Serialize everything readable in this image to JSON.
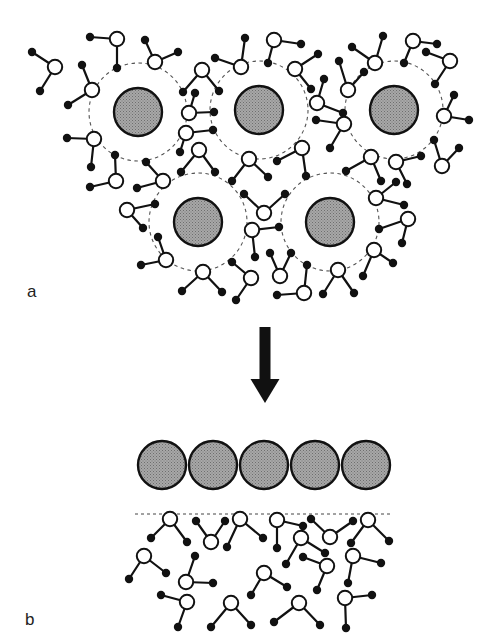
{
  "figure": {
    "labels": {
      "a": "a",
      "b": "b"
    },
    "colors": {
      "particle_fill": "#9c9c9c",
      "outline": "#111111",
      "oxygen_fill": "#ffffff",
      "hydrogen_fill": "#111111",
      "shell_stroke": "#555555",
      "background": "#ffffff"
    },
    "legend_semantics": {
      "particle": "gray stippled sphere (hydrated ion / particle)",
      "water_oxygen": "open circle",
      "water_hydrogen": "filled dot",
      "hydration_shell": "dashed circle"
    },
    "panel_a": {
      "particles": [
        {
          "cx": 138,
          "cy": 112,
          "r": 24
        },
        {
          "cx": 259,
          "cy": 110,
          "r": 24
        },
        {
          "cx": 394,
          "cy": 110,
          "r": 24
        },
        {
          "cx": 198,
          "cy": 222,
          "r": 24
        },
        {
          "cx": 330,
          "cy": 222,
          "r": 24
        }
      ],
      "shell_radius": 49,
      "waters": [
        {
          "o": [
            55,
            67
          ],
          "h": [
            [
              32,
              52
            ],
            [
              40,
              91
            ]
          ]
        },
        {
          "o": [
            117,
            39
          ],
          "h": [
            [
              90,
              37
            ],
            [
              117,
              68
            ]
          ]
        },
        {
          "o": [
            92,
            90
          ],
          "h": [
            [
              82,
              65
            ],
            [
              68,
              105
            ]
          ]
        },
        {
          "o": [
            155,
            62
          ],
          "h": [
            [
              145,
              40
            ],
            [
              178,
              52
            ]
          ]
        },
        {
          "o": [
            202,
            70
          ],
          "h": [
            [
              183,
              92
            ],
            [
              219,
              91
            ]
          ]
        },
        {
          "o": [
            241,
            67
          ],
          "h": [
            [
              215,
              58
            ],
            [
              245,
              38
            ]
          ]
        },
        {
          "o": [
            189,
            113
          ],
          "h": [
            [
              195,
              93
            ],
            [
              214,
              112
            ]
          ]
        },
        {
          "o": [
            186,
            133
          ],
          "h": [
            [
              213,
              130
            ],
            [
              180,
              152
            ]
          ]
        },
        {
          "o": [
            274,
            40
          ],
          "h": [
            [
              268,
              63
            ],
            [
              301,
              44
            ]
          ]
        },
        {
          "o": [
            295,
            69
          ],
          "h": [
            [
              318,
              54
            ],
            [
              311,
              89
            ]
          ]
        },
        {
          "o": [
            317,
            103
          ],
          "h": [
            [
              324,
              79
            ],
            [
              343,
              113
            ]
          ]
        },
        {
          "o": [
            348,
            90
          ],
          "h": [
            [
              339,
              61
            ],
            [
              364,
              72
            ]
          ]
        },
        {
          "o": [
            375,
            63
          ],
          "h": [
            [
              352,
              47
            ],
            [
              383,
              36
            ]
          ]
        },
        {
          "o": [
            344,
            124
          ],
          "h": [
            [
              316,
              120
            ],
            [
              330,
              148
            ]
          ]
        },
        {
          "o": [
            413,
            41
          ],
          "h": [
            [
              404,
              63
            ],
            [
              437,
              44
            ]
          ]
        },
        {
          "o": [
            450,
            61
          ],
          "h": [
            [
              426,
              52
            ],
            [
              435,
              84
            ]
          ]
        },
        {
          "o": [
            444,
            116
          ],
          "h": [
            [
              454,
              95
            ],
            [
              469,
              120
            ]
          ]
        },
        {
          "o": [
            94,
            139
          ],
          "h": [
            [
              67,
              138
            ],
            [
              91,
              167
            ]
          ]
        },
        {
          "o": [
            199,
            150
          ],
          "h": [
            [
              181,
              172
            ],
            [
              215,
              172
            ]
          ]
        },
        {
          "o": [
            116,
            181
          ],
          "h": [
            [
              115,
              155
            ],
            [
              90,
              187
            ]
          ]
        },
        {
          "o": [
            163,
            181
          ],
          "h": [
            [
              146,
              162
            ],
            [
              137,
              188
            ]
          ]
        },
        {
          "o": [
            127,
            210
          ],
          "h": [
            [
              155,
              204
            ],
            [
              143,
              228
            ]
          ]
        },
        {
          "o": [
            249,
            159
          ],
          "h": [
            [
              232,
              181
            ],
            [
              268,
              177
            ]
          ]
        },
        {
          "o": [
            302,
            148
          ],
          "h": [
            [
              277,
              161
            ],
            [
              306,
              176
            ]
          ]
        },
        {
          "o": [
            264,
            213
          ],
          "h": [
            [
              244,
              194
            ],
            [
              285,
              194
            ]
          ]
        },
        {
          "o": [
            252,
            230
          ],
          "h": [
            [
              279,
              227
            ],
            [
              255,
              257
            ]
          ]
        },
        {
          "o": [
            371,
            157
          ],
          "h": [
            [
              346,
              171
            ],
            [
              381,
              181
            ]
          ]
        },
        {
          "o": [
            396,
            162
          ],
          "h": [
            [
              421,
              156
            ],
            [
              407,
              184
            ]
          ]
        },
        {
          "o": [
            442,
            166
          ],
          "h": [
            [
              434,
              140
            ],
            [
              459,
              148
            ]
          ]
        },
        {
          "o": [
            376,
            198
          ],
          "h": [
            [
              396,
              182
            ],
            [
              404,
              205
            ]
          ]
        },
        {
          "o": [
            408,
            219
          ],
          "h": [
            [
              379,
              229
            ],
            [
              402,
              243
            ]
          ]
        },
        {
          "o": [
            374,
            250
          ],
          "h": [
            [
              363,
              276
            ],
            [
              393,
              263
            ]
          ]
        },
        {
          "o": [
            338,
            270
          ],
          "h": [
            [
              323,
              294
            ],
            [
              354,
              293
            ]
          ]
        },
        {
          "o": [
            166,
            260
          ],
          "h": [
            [
              158,
              237
            ],
            [
              141,
              265
            ]
          ]
        },
        {
          "o": [
            203,
            272
          ],
          "h": [
            [
              182,
              291
            ],
            [
              222,
              292
            ]
          ]
        },
        {
          "o": [
            251,
            278
          ],
          "h": [
            [
              232,
              262
            ],
            [
              236,
              300
            ]
          ]
        },
        {
          "o": [
            280,
            276
          ],
          "h": [
            [
              270,
              253
            ],
            [
              291,
              253
            ]
          ]
        },
        {
          "o": [
            304,
            293
          ],
          "h": [
            [
              307,
              265
            ],
            [
              277,
              295
            ]
          ]
        }
      ]
    },
    "arrow": {
      "x": 265,
      "y_start": 327,
      "y_end": 403,
      "direction": "down"
    },
    "panel_b": {
      "particles": [
        {
          "cx": 162,
          "cy": 465,
          "r": 24
        },
        {
          "cx": 213,
          "cy": 465,
          "r": 24
        },
        {
          "cx": 264,
          "cy": 465,
          "r": 24
        },
        {
          "cx": 315,
          "cy": 465,
          "r": 24
        },
        {
          "cx": 366,
          "cy": 465,
          "r": 24
        }
      ],
      "surface_line": {
        "x1": 135,
        "x2": 392,
        "y": 514
      },
      "waters": [
        {
          "o": [
            170,
            519
          ],
          "h": [
            [
              151,
              538
            ],
            [
              187,
              542
            ]
          ]
        },
        {
          "o": [
            211,
            542
          ],
          "h": [
            [
              196,
              521
            ],
            [
              225,
              521
            ]
          ]
        },
        {
          "o": [
            240,
            519
          ],
          "h": [
            [
              227,
              547
            ],
            [
              263,
              538
            ]
          ]
        },
        {
          "o": [
            277,
            520
          ],
          "h": [
            [
              277,
              548
            ],
            [
              303,
              526
            ]
          ]
        },
        {
          "o": [
            330,
            537
          ],
          "h": [
            [
              311,
              519
            ],
            [
              353,
              521
            ]
          ]
        },
        {
          "o": [
            368,
            520
          ],
          "h": [
            [
              351,
              543
            ],
            [
              389,
              541
            ]
          ]
        },
        {
          "o": [
            144,
            556
          ],
          "h": [
            [
              129,
              579
            ],
            [
              166,
              573
            ]
          ]
        },
        {
          "o": [
            301,
            538
          ],
          "h": [
            [
              286,
              564
            ],
            [
              325,
              553
            ]
          ]
        },
        {
          "o": [
            327,
            566
          ],
          "h": [
            [
              303,
              557
            ],
            [
              317,
              590
            ]
          ]
        },
        {
          "o": [
            353,
            556
          ],
          "h": [
            [
              348,
              583
            ],
            [
              381,
              563
            ]
          ]
        },
        {
          "o": [
            186,
            582
          ],
          "h": [
            [
              195,
              556
            ],
            [
              213,
              583
            ]
          ]
        },
        {
          "o": [
            264,
            573
          ],
          "h": [
            [
              251,
              595
            ],
            [
              287,
              587
            ]
          ]
        },
        {
          "o": [
            187,
            602
          ],
          "h": [
            [
              161,
              595
            ],
            [
              178,
              627
            ]
          ]
        },
        {
          "o": [
            231,
            603
          ],
          "h": [
            [
              211,
              627
            ],
            [
              251,
              625
            ]
          ]
        },
        {
          "o": [
            299,
            603
          ],
          "h": [
            [
              274,
              622
            ],
            [
              320,
              625
            ]
          ]
        },
        {
          "o": [
            345,
            598
          ],
          "h": [
            [
              372,
              595
            ],
            [
              346,
              628
            ]
          ]
        }
      ]
    }
  }
}
